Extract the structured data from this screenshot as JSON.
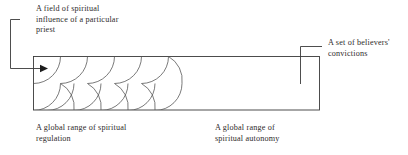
{
  "diagram": {
    "stroke_color": "#3a3a3a",
    "arc_stroke_color": "#585858",
    "background": "#ffffff",
    "labels": {
      "priest_field": "A field of spiritual\ninfluence of a particular\npriest",
      "believers_convictions": "A set of believers'\nconvictions",
      "spiritual_regulation": "A global range of spiritual\nregulation",
      "spiritual_autonomy": "A global range of\nspiritual autonomy"
    },
    "shapes": {
      "rectangle_label": "believers field rectangle",
      "arrow_label": "priest influence arrow",
      "scallop_label": "overlapping spiritual influence arcs"
    }
  }
}
